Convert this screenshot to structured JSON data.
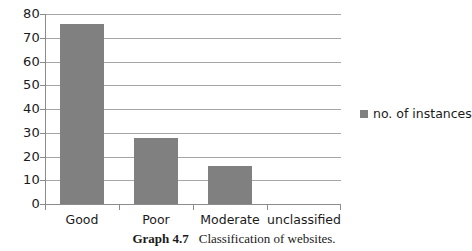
{
  "chart_data": {
    "type": "bar",
    "title": "",
    "subtitle": "",
    "xlabel": "",
    "ylabel": "",
    "categories": [
      "Good",
      "Poor",
      "Moderate",
      "unclassified"
    ],
    "values": [
      76,
      28,
      16,
      0
    ],
    "series": [
      {
        "name": "no. of instances",
        "values": [
          76,
          28,
          16,
          0
        ]
      }
    ],
    "ylim": [
      0,
      80
    ],
    "yticks": [
      0,
      10,
      20,
      30,
      40,
      50,
      60,
      70,
      80
    ],
    "ytick_labels": [
      "0",
      "10",
      "20",
      "30",
      "40",
      "50",
      "60",
      "70",
      "80"
    ],
    "grid": true,
    "grid_axis": "y",
    "legend": {
      "position": "right",
      "entries": [
        {
          "label": "no. of instances",
          "color": "#808080"
        }
      ]
    },
    "bar_color": "#808080",
    "gridline_color": "#a6a6a6",
    "axis_color": "#8c8c8c",
    "background_color": "#ffffff"
  },
  "caption": {
    "number": "Graph 4.7",
    "text": "Classification of websites."
  }
}
